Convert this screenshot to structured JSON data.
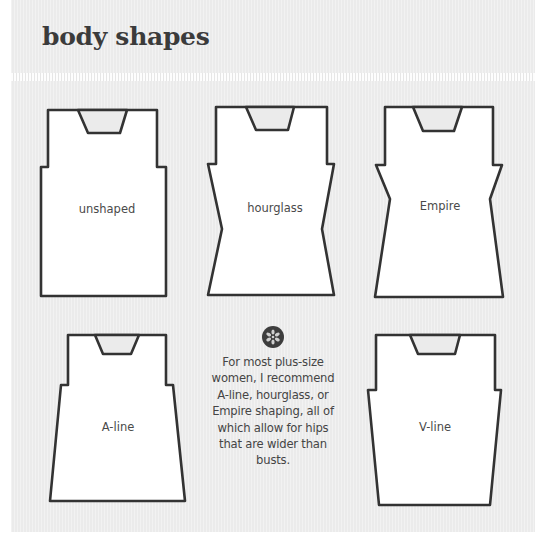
{
  "header": {
    "title": "body shapes"
  },
  "colors": {
    "panel_bg": "#ebebeb",
    "outline": "#333333",
    "garment_fill": "#ffffff",
    "text": "#454545",
    "icon_bg": "#3d3d3d"
  },
  "shapes": [
    {
      "name": "unshaped",
      "label": "unshaped",
      "label_pos": [
        107,
        209
      ],
      "outline": "48,110 157,110 157,167 166,167 166,296 41,296 41,167 48,167",
      "neck": "78,110 127,110 120,133 88,133"
    },
    {
      "name": "hourglass",
      "label": "hourglass",
      "label_pos": [
        275,
        208
      ],
      "outline": "216,107 327,107 327,164 334,164 322,229 334,295 208,295 222,229 208,164 216,164",
      "neck": "246,107 294,107 288,130 256,130"
    },
    {
      "name": "empire",
      "label": "Empire",
      "label_pos": [
        440,
        206
      ],
      "outline": "385,107 493,107 493,165 502,165 490,199 503,297 375,297 390,199 376,165 385,165",
      "neck": "413,107 462,107 454,131 423,131"
    },
    {
      "name": "a-line",
      "label": "A-line",
      "label_pos": [
        118,
        427
      ],
      "outline": "68,335 166,335 166,385 173,385 185,501 50,501 61,385 68,385",
      "neck": "95,335 139,335 131,354 103,354"
    },
    {
      "name": "v-line",
      "label": "V-line",
      "label_pos": [
        435,
        427
      ],
      "outline": "376,335 495,335 495,390 501,390 490,505 379,505 368,390 376,390",
      "neck": "410,335 460,335 455,354 418,354"
    }
  ],
  "note": {
    "icon": "asterisk-flower-icon",
    "lines": [
      "For most plus-size",
      "women, I recommend",
      "A-line, hourglass, or",
      "Empire shaping, all of",
      "which allow for hips",
      "that are wider than",
      "busts."
    ]
  }
}
